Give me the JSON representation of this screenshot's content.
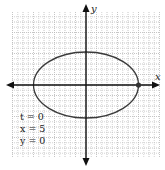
{
  "chart_data": {
    "type": "line",
    "title": "",
    "xlabel": "x",
    "ylabel": "y",
    "grid": true,
    "xlim": [
      -7.5,
      7.5
    ],
    "ylim": [
      -7.5,
      7.5
    ],
    "curve": {
      "shape": "ellipse",
      "center": [
        0,
        0
      ],
      "semi_major_x": 5,
      "semi_minor_y": 3
    },
    "highlighted_point": {
      "x": 5,
      "y": 0
    },
    "annotations": [
      "t = 0",
      "x = 5",
      "y = 0"
    ]
  },
  "axes": {
    "x_label": "x",
    "y_label": "y"
  },
  "annotation": {
    "t_line": "t = 0",
    "x_line": "x = 5",
    "y_line": "y = 0"
  },
  "colors": {
    "curve": "#3a3a3a",
    "axis": "#111111",
    "grid": "#b8b8b8",
    "point": "#333333"
  }
}
